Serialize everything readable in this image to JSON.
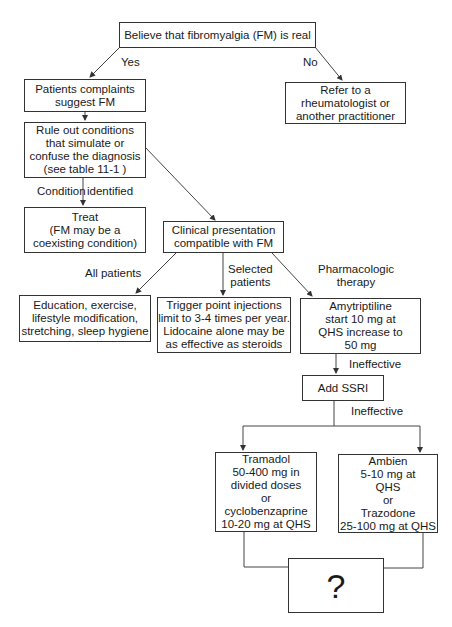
{
  "nodes": {
    "root": {
      "lines": [
        "Believe that fibromyalgia (FM) is real"
      ]
    },
    "patients": {
      "lines": [
        "Patients complaints",
        "suggest FM"
      ]
    },
    "refer": {
      "lines": [
        "Refer to a",
        "rheumatologist or",
        "another practitioner"
      ]
    },
    "rule_out": {
      "lines": [
        "Rule out conditions",
        "that simulate or",
        "confuse the diagnosis",
        "(see table 11-1  )"
      ]
    },
    "treat": {
      "lines": [
        "Treat",
        "(FM may be a",
        "coexisting condition)"
      ]
    },
    "clinical": {
      "lines": [
        "Clinical presentation",
        "compatible with FM"
      ]
    },
    "education": {
      "lines": [
        "Education, exercise,",
        "lifestyle modification,",
        "stretching, sleep hygiene"
      ]
    },
    "trigger": {
      "lines": [
        "Trigger point injections",
        "limit to 3-4 times per year.",
        "Lidocaine alone may be",
        "as effective as steroids"
      ]
    },
    "amytriptiline": {
      "lines": [
        "Amytriptiline",
        "start 10 mg at",
        "QHS increase to",
        "50 mg"
      ]
    },
    "ssri": {
      "lines": [
        "Add SSRI"
      ]
    },
    "tramadol": {
      "lines": [
        "Tramadol",
        "50-400 mg in",
        "divided doses",
        "or",
        "cyclobenzaprine",
        "10-20 mg at QHS"
      ]
    },
    "ambien": {
      "lines": [
        "Ambien",
        "5-10 mg at",
        "QHS",
        "or",
        "Trazodone",
        "25-100 mg at QHS"
      ]
    },
    "unknown": {
      "lines": [
        "?"
      ]
    }
  },
  "edge_labels": {
    "yes": "Yes",
    "no": "No",
    "condition": "Condition",
    "identified": "identified",
    "all_patients": "All patients",
    "selected": [
      "Selected",
      "patients"
    ],
    "pharmacologic": [
      "Pharmacologic",
      "therapy"
    ],
    "ineffective_1": "Ineffective",
    "ineffective_2": "Ineffective"
  }
}
